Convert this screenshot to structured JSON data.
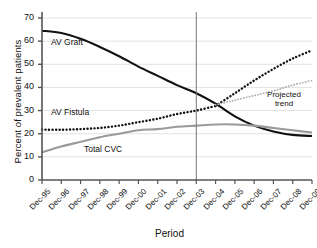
{
  "chart_data": {
    "type": "line",
    "title": "",
    "xlabel": "Period",
    "ylabel": "Percent of prevalent patients",
    "categories": [
      "Dec-95",
      "Dec-96",
      "Dec-97",
      "Dec-98",
      "Dec-99",
      "Dec-00",
      "Dec-01",
      "Dec-02",
      "Dec-03",
      "Dec-04",
      "Dec-05",
      "Dec-06",
      "Dec-07",
      "Dec-08",
      "Dec-09"
    ],
    "ylim": [
      0,
      70
    ],
    "yticks": [
      0,
      10,
      20,
      30,
      40,
      50,
      60,
      70
    ],
    "grid": true,
    "legend_position": "inline-labels",
    "reference_line": {
      "label": "Dec-03",
      "x": "Dec-03"
    },
    "series": [
      {
        "name": "AV Graft",
        "style": "solid-black",
        "color": "#111111",
        "values": [
          64.5,
          63.5,
          61.0,
          57.5,
          53.5,
          49.0,
          45.0,
          41.0,
          37.5,
          33.0,
          27.5,
          23.5,
          21.0,
          19.5,
          19.0
        ]
      },
      {
        "name": "AV Fistula",
        "style": "dotted-black",
        "color": "#111111",
        "values": [
          21.8,
          21.7,
          22.0,
          22.5,
          23.5,
          25.0,
          26.5,
          28.5,
          30.0,
          32.0,
          null,
          null,
          null,
          null,
          null
        ]
      },
      {
        "name": "AV Fistula projected trend",
        "style": "dotted-black",
        "color": "#111111",
        "projected": true,
        "values": [
          null,
          null,
          null,
          null,
          null,
          null,
          null,
          null,
          null,
          32.0,
          37.5,
          43.0,
          48.0,
          52.5,
          56.0
        ]
      },
      {
        "name": "Total CVC",
        "style": "solid-gray",
        "color": "#9a9a9a",
        "values": [
          12.0,
          14.5,
          16.5,
          18.5,
          20.0,
          21.5,
          22.0,
          23.0,
          23.5,
          24.0,
          24.0,
          23.5,
          22.5,
          21.5,
          20.5
        ]
      },
      {
        "name": "Total CVC projected trend",
        "style": "dotted-gray",
        "color": "#b0b0b0",
        "projected": true,
        "values": [
          null,
          null,
          null,
          null,
          null,
          null,
          null,
          null,
          null,
          32.5,
          34.5,
          36.5,
          38.5,
          41.0,
          43.0
        ]
      }
    ],
    "annotations": [
      {
        "text": "AV Graft",
        "series": "AV Graft"
      },
      {
        "text": "AV Fistula",
        "series": "AV Fistula"
      },
      {
        "text": "Total CVC",
        "series": "Total CVC"
      },
      {
        "text": "Projected",
        "series": "projected-trend"
      },
      {
        "text": "trend",
        "series": "projected-trend"
      }
    ]
  },
  "axis": {
    "y_title": "Percent of prevalent patients",
    "x_title": "Period",
    "y_ticks": [
      "70",
      "60",
      "50",
      "40",
      "30",
      "20",
      "10",
      "0"
    ],
    "x_ticks": [
      "Dec-95",
      "Dec-96",
      "Dec-97",
      "Dec-98",
      "Dec-99",
      "Dec-00",
      "Dec-01",
      "Dec-02",
      "Dec-03",
      "Dec-04",
      "Dec-05",
      "Dec-06",
      "Dec-07",
      "Dec-08",
      "Dec-09"
    ]
  },
  "labels": {
    "av_graft": "AV Graft",
    "av_fistula": "AV Fistula",
    "total_cvc": "Total CVC",
    "projected_line1": "Projected",
    "projected_line2": "trend"
  },
  "colors": {
    "graft": "#111111",
    "fistula": "#111111",
    "cvc": "#9a9a9a",
    "projected_cvc": "#b0b0b0",
    "grid": "#e2e2e2",
    "axis": "#555555",
    "refline": "#777777"
  }
}
